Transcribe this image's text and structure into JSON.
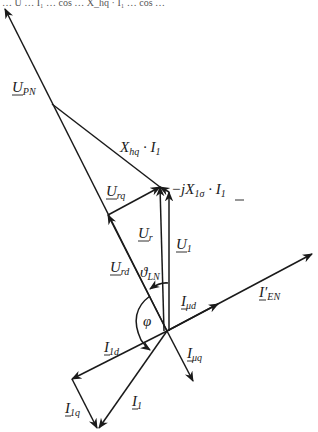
{
  "diagram": {
    "cropped_header_text": "…  U  …  I₁  …  cos  …  X_hq · I₁  …  cos  …",
    "origin": {
      "x": 167,
      "y": 331
    },
    "labels": {
      "U_PN": {
        "main": "U",
        "sub": "PN"
      },
      "X_hq_I1": {
        "main": "X",
        "sub": "hq",
        "rest": " · I",
        "sub2": "1"
      },
      "U_rq": {
        "main": "U",
        "sub": "rq"
      },
      "jX1s_I1": {
        "main": "−jX",
        "sub": "1σ",
        "rest": " · I",
        "sub2": "1"
      },
      "U_r": {
        "main": "U",
        "sub": "r"
      },
      "U_1": {
        "main": "U",
        "sub": "1"
      },
      "U_rd": {
        "main": "U",
        "sub": "rd"
      },
      "theta_LN": {
        "main": "ϑ",
        "sub": "LN"
      },
      "I_mud": {
        "main": "I",
        "sub": "μd"
      },
      "I_EN": {
        "main": "I′",
        "sub": "EN"
      },
      "phi": {
        "main": "φ"
      },
      "I_1d": {
        "main": "I",
        "sub": "1d"
      },
      "I_muq": {
        "main": "I",
        "sub": "μq"
      },
      "I_1q": {
        "main": "I",
        "sub": "1q"
      },
      "I_1": {
        "main": "I",
        "sub": "1"
      }
    },
    "colors": {
      "stroke": "#1a1a1a",
      "background": "#ffffff"
    }
  }
}
